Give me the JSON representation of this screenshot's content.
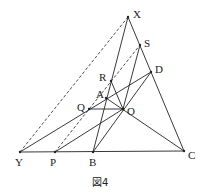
{
  "figure": {
    "caption": "図4",
    "points": {
      "X": {
        "label": "X",
        "x": 128,
        "y": 17
      },
      "S": {
        "label": "S",
        "x": 140,
        "y": 45
      },
      "D": {
        "label": "D",
        "x": 151,
        "y": 72
      },
      "R": {
        "label": "R",
        "x": 111,
        "y": 81
      },
      "A": {
        "label": "A",
        "x": 106,
        "y": 98
      },
      "Q": {
        "label": "Q",
        "x": 89,
        "y": 109
      },
      "O": {
        "label": "O",
        "x": 123,
        "y": 109
      },
      "Y": {
        "label": "Y",
        "x": 20,
        "y": 152
      },
      "P": {
        "label": "P",
        "x": 55,
        "y": 152
      },
      "B": {
        "label": "B",
        "x": 93,
        "y": 152
      },
      "C": {
        "label": "C",
        "x": 184,
        "y": 151
      }
    },
    "solid_segments": [
      [
        "X",
        "C"
      ],
      [
        "Y",
        "C"
      ],
      [
        "X",
        "B"
      ],
      [
        "Y",
        "D"
      ],
      [
        "P",
        "O"
      ],
      [
        "Q",
        "O"
      ],
      [
        "R",
        "O"
      ],
      [
        "S",
        "B"
      ],
      [
        "D",
        "B"
      ],
      [
        "A",
        "C"
      ]
    ],
    "dashed_segments": [
      [
        "Y",
        "X"
      ],
      [
        "P",
        "S"
      ]
    ]
  }
}
